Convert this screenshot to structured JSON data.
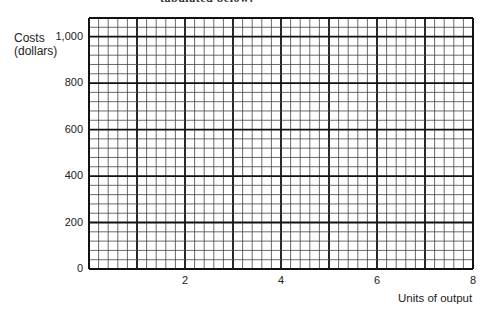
{
  "heading_fragment": "tabulated below:",
  "chart_data": {
    "type": "line",
    "title": "",
    "xlabel": "Units of output",
    "ylabel": "Costs (dollars)",
    "ylabel_lines": [
      "Costs",
      "(dollars)"
    ],
    "x_ticks": [
      {
        "value": 2,
        "label": "2"
      },
      {
        "value": 4,
        "label": "4"
      },
      {
        "value": 6,
        "label": "6"
      },
      {
        "value": 8,
        "label": "8"
      }
    ],
    "y_ticks": [
      {
        "value": 0,
        "label": "0"
      },
      {
        "value": 200,
        "label": "200"
      },
      {
        "value": 400,
        "label": "400"
      },
      {
        "value": 600,
        "label": "600"
      },
      {
        "value": 800,
        "label": "800"
      },
      {
        "value": 1000,
        "label": "1,000"
      }
    ],
    "xlim": [
      0,
      8
    ],
    "ylim": [
      0,
      1080
    ],
    "grid": true,
    "grid_minor_x_step": 0.2,
    "grid_minor_y_step": 40,
    "grid_major_x_step": 1,
    "grid_major_y_step": 200,
    "series": [],
    "legend": null
  },
  "plot_area": {
    "left": 89,
    "right": 473,
    "top": 18,
    "bottom": 269
  },
  "colors": {
    "major_line": "#111111",
    "minor_line": "#444444",
    "background": "#ffffff"
  }
}
